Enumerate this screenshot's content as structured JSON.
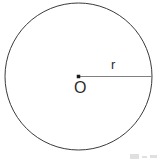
{
  "figure": {
    "type": "geometry-diagram",
    "background_color": "#ffffff",
    "width": 160,
    "height": 162,
    "circle": {
      "name": "circle-outline",
      "center_x": 78.5,
      "center_y": 76.5,
      "radius": 73.5,
      "stroke_color": "#3a3a3a",
      "stroke_width": 1,
      "fill": "none"
    },
    "center_point": {
      "name": "center-point",
      "x": 78.5,
      "y": 76.5,
      "size": 3.5,
      "color": "#1a1a1a"
    },
    "radius_line": {
      "name": "radius-segment",
      "x1": 78.5,
      "y1": 76.5,
      "x2": 152,
      "y2": 76.5,
      "stroke_color": "#808080",
      "stroke_width": 1.2
    },
    "labels": {
      "radius": "r",
      "center": "O"
    },
    "watermark": {
      "visible": true,
      "legible": false,
      "color": "#9a9a9a"
    }
  }
}
